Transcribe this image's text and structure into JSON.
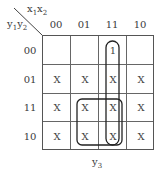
{
  "corner": {
    "column_variables": "x1x2",
    "row_variables": "y1y2"
  },
  "column_headers": [
    "00",
    "01",
    "11",
    "10"
  ],
  "row_headers": [
    "00",
    "01",
    "11",
    "10"
  ],
  "cells": [
    [
      "",
      "",
      "1",
      ""
    ],
    [
      "X",
      "X",
      "X",
      "X"
    ],
    [
      "X",
      "X",
      "X",
      "X"
    ],
    [
      "X",
      "X",
      "X",
      "X"
    ]
  ],
  "groups": [
    {
      "name": "column-11-vertical-loop",
      "cols": [
        "11"
      ],
      "rows": [
        "00",
        "01",
        "11",
        "10"
      ]
    },
    {
      "name": "square-loop",
      "cols": [
        "01",
        "11"
      ],
      "rows": [
        "11",
        "10"
      ]
    }
  ],
  "output_label": "y3"
}
